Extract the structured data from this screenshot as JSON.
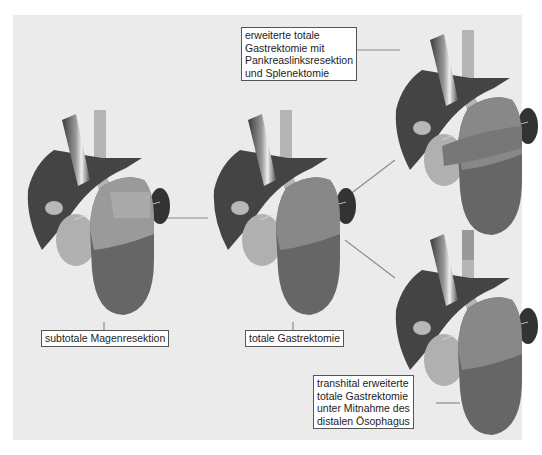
{
  "diagram": {
    "type": "surgical-procedure-comparison",
    "colors": {
      "background_panel": "#ebebeb",
      "liver": "#444444",
      "stomach_remnant": "#8a8a8a",
      "resected_stomach": "#666666",
      "esophagus": "#b5b5b5",
      "spleen": "#333333",
      "pancreas": "#b0b0b0",
      "connector": "#8c8c8c"
    },
    "procedures": [
      {
        "id": "subtotal",
        "label": "subtotale Magenresektion"
      },
      {
        "id": "total",
        "label": "totale Gastrektomie"
      },
      {
        "id": "extended",
        "label": "erweiterte totale Gastrektomie mit Pankreaslinksresektion und Splenektomie",
        "lines": [
          "erweiterte totale",
          "Gastrektomie mit",
          "Pankreaslinksresektion",
          "und Splenektomie"
        ]
      },
      {
        "id": "transhiatal",
        "label": "transhital erweiterte totale Gastrektomie unter Mitnahme des distalen Ösophagus",
        "lines": [
          "transhital erweiterte",
          "totale Gastrektomie",
          "unter Mitnahme des",
          "distalen Ösophagus"
        ]
      }
    ]
  }
}
